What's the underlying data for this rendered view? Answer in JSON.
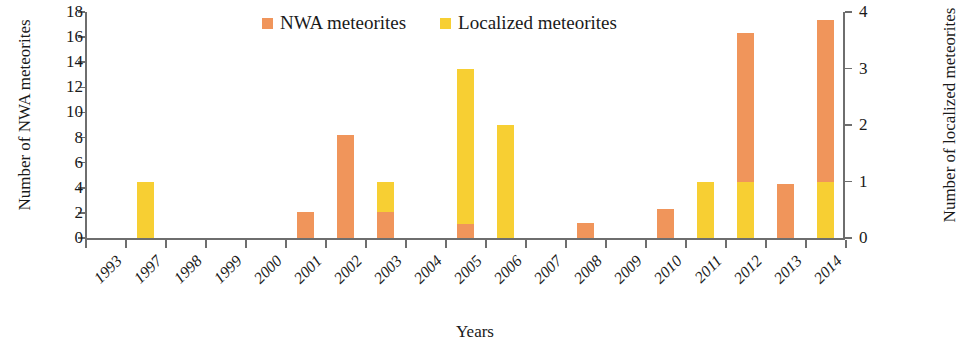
{
  "chart_data": {
    "type": "bar",
    "title": "",
    "subtitle": "",
    "xlabel": "Years",
    "ylabel": "Number of NWA meteorites",
    "ylabel_right": "Number of localized meteorites",
    "ylim": [
      0,
      18
    ],
    "ylim_right": [
      0,
      4
    ],
    "yticks": [
      0,
      2,
      4,
      6,
      8,
      10,
      12,
      14,
      16,
      18
    ],
    "yticks_right": [
      0,
      1,
      2,
      3,
      4
    ],
    "grid": false,
    "legend_position": "top-center",
    "stacked": true,
    "categories": [
      "1993",
      "1997",
      "1998",
      "1999",
      "2000",
      "2001",
      "2002",
      "2003",
      "2004",
      "2005",
      "2006",
      "2007",
      "2008",
      "2009",
      "2010",
      "2011",
      "2012",
      "2013",
      "2014"
    ],
    "series": [
      {
        "name": "NWA meteorites",
        "color": "#f0955b",
        "axis": "left",
        "values": [
          0,
          0,
          0,
          0,
          0,
          2.1,
          8.2,
          2.1,
          0,
          1.1,
          0,
          0,
          1.2,
          0,
          2.3,
          0,
          16.3,
          4.3,
          17.4
        ]
      },
      {
        "name": "Localized meteorites",
        "color": "#f7cf33",
        "axis": "right",
        "values": [
          0,
          1,
          0,
          0,
          0,
          0,
          0,
          1,
          0,
          3,
          2,
          0,
          0,
          0,
          0,
          1,
          1,
          0,
          1
        ]
      }
    ]
  },
  "legend": {
    "items": [
      {
        "label": "NWA meteorites",
        "color": "#f0955b"
      },
      {
        "label": "Localized meteorites",
        "color": "#f7cf33"
      }
    ]
  },
  "axes": {
    "left_title": "Number of NWA meteorites",
    "right_title": "Number of localized meteorites",
    "x_title": "Years",
    "left_ticks": [
      "0",
      "2",
      "4",
      "6",
      "8",
      "10",
      "12",
      "14",
      "16",
      "18"
    ],
    "right_ticks": [
      "0",
      "1",
      "2",
      "3",
      "4"
    ],
    "x_ticks": [
      "1993",
      "1997",
      "1998",
      "1999",
      "2000",
      "2001",
      "2002",
      "2003",
      "2004",
      "2005",
      "2006",
      "2007",
      "2008",
      "2009",
      "2010",
      "2011",
      "2012",
      "2013",
      "2014"
    ]
  },
  "colors": {
    "nwa": "#f0955b",
    "localized": "#f7cf33",
    "axis": "#6e6e6e",
    "text": "#1a1a1a",
    "background": "#ffffff"
  }
}
